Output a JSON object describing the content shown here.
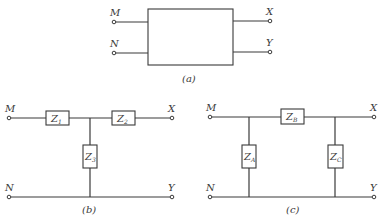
{
  "panel_a": {
    "caption": "(a)",
    "terminals": {
      "top_left": "M",
      "bottom_left": "N",
      "top_right": "X",
      "bottom_right": "Y"
    }
  },
  "panel_b": {
    "caption": "(b)",
    "terminals": {
      "top_left": "M",
      "bottom_left": "N",
      "top_right": "X",
      "bottom_right": "Y"
    },
    "impedances": [
      {
        "main": "Z",
        "sub": "1"
      },
      {
        "main": "Z",
        "sub": "2"
      },
      {
        "main": "Z",
        "sub": "3"
      }
    ]
  },
  "panel_c": {
    "caption": "(c)",
    "terminals": {
      "top_left": "M",
      "bottom_left": "N",
      "top_right": "X",
      "bottom_right": "Y"
    },
    "impedances": [
      {
        "main": "Z",
        "sub": "A"
      },
      {
        "main": "Z",
        "sub": "B"
      },
      {
        "main": "Z",
        "sub": "C"
      }
    ]
  }
}
